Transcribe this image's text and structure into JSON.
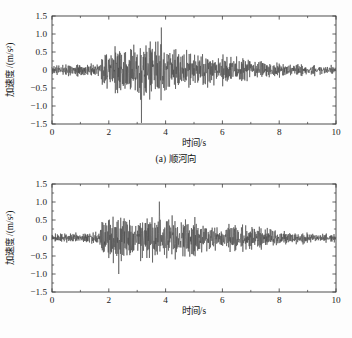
{
  "figure": {
    "background_color": "#fdfdfd",
    "line_color": "#4a4a4a",
    "axis_color": "#3a3a3a"
  },
  "chart_data": [
    {
      "type": "line",
      "panel_id": "a",
      "title": "",
      "caption": "(a) 顺河向",
      "xlabel": "时间/s",
      "ylabel": "加速度 /(m/s²)",
      "xlim": [
        0,
        10
      ],
      "ylim": [
        -1.5,
        1.5
      ],
      "xticks": [
        0,
        2,
        4,
        6,
        8,
        10
      ],
      "xticklabels": [
        "0",
        "2",
        "4",
        "6",
        "8",
        "10"
      ],
      "xminorticks": [
        1,
        3,
        5,
        7,
        9
      ],
      "yticks": [
        -1.5,
        -1.0,
        -0.5,
        0,
        0.5,
        1.0,
        1.5
      ],
      "yticklabels": [
        "-1.5",
        "-1.0",
        "-0.5",
        "0",
        "0.5",
        "1.0",
        "1.5"
      ],
      "yminorticks": [
        -1.25,
        -0.75,
        -0.25,
        0.25,
        0.75,
        1.25
      ],
      "grid": false,
      "legend": false,
      "series_name": "顺河向加速度时程",
      "sampling_interval_s": 0.01,
      "n_points": 1000,
      "envelope_description": "quiet low-amplitude noise 0-1.7 s, strong shaking 1.8-4.6 s peaking near 3.1-4.1 s, moderate 4.6-7.1 s, decaying tail 7.1-10 s",
      "peak_positive": 1.18,
      "peak_positive_time": 3.85,
      "peak_negative": -1.47,
      "peak_negative_time": 3.15,
      "rms_quiet_region": 0.09,
      "rms_strong_region": 0.42
    },
    {
      "type": "line",
      "panel_id": "b",
      "title": "",
      "caption": "(b) 竖向",
      "xlabel": "时间/s",
      "ylabel": "加速度 /(m/s²)",
      "xlim": [
        0,
        10
      ],
      "ylim": [
        -1.5,
        1.5
      ],
      "xticks": [
        0,
        2,
        4,
        6,
        8,
        10
      ],
      "xticklabels": [
        "0",
        "2",
        "4",
        "6",
        "8",
        "10"
      ],
      "xminorticks": [
        1,
        3,
        5,
        7,
        9
      ],
      "yticks": [
        -1.5,
        -1.0,
        -0.5,
        0,
        0.5,
        1.0,
        1.5
      ],
      "yticklabels": [
        "-1.5",
        "-1.0",
        "-0.5",
        "0",
        "0.5",
        "1.0",
        "1.5"
      ],
      "yminorticks": [
        -1.25,
        -0.75,
        -0.25,
        0.25,
        0.75,
        1.25
      ],
      "grid": false,
      "legend": false,
      "series_name": "竖向加速度时程",
      "sampling_interval_s": 0.01,
      "n_points": 1000,
      "envelope_description": "low-amplitude noise 0-1.6 s, strong shaking 1.7-5.0 s peaking near 3.7-3.9 s, sustained moderate 5.0-7.6 s, decaying tail 7.6-10 s",
      "peak_positive": 1.01,
      "peak_positive_time": 3.78,
      "peak_negative": -1.0,
      "peak_negative_time": 2.35,
      "rms_quiet_region": 0.08,
      "rms_strong_region": 0.36
    }
  ]
}
